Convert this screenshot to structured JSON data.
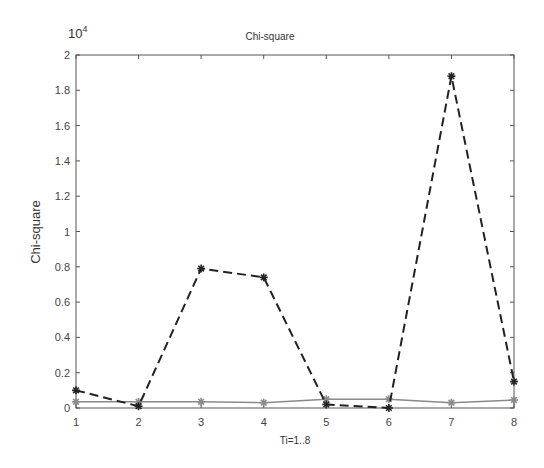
{
  "chart_data": {
    "type": "line",
    "title": "Chi-square",
    "xlabel": "Ti=1..8",
    "ylabel": "Chi-square",
    "y_exponent_label": "10",
    "y_exponent_power": "4",
    "x": [
      1,
      2,
      3,
      4,
      5,
      6,
      7,
      8
    ],
    "x_ticks": [
      "1",
      "2",
      "3",
      "4",
      "5",
      "6",
      "7",
      "8"
    ],
    "y_ticks": [
      "0",
      "0.2",
      "0.4",
      "0.6",
      "0.8",
      "1",
      "1.2",
      "1.4",
      "1.6",
      "1.8",
      "2"
    ],
    "xlim": [
      1,
      8
    ],
    "ylim": [
      0,
      2
    ],
    "y_scale": 10000,
    "grid": false,
    "legend": null,
    "series": [
      {
        "name": "dashed-black",
        "color": "#222222",
        "line_style": "dashed",
        "marker": "*",
        "values": [
          0.1,
          0.01,
          0.79,
          0.74,
          0.02,
          0.0,
          1.88,
          0.15
        ]
      },
      {
        "name": "solid-gray",
        "color": "#8a8a8a",
        "line_style": "solid",
        "marker": "*",
        "values": [
          0.035,
          0.035,
          0.035,
          0.03,
          0.05,
          0.05,
          0.03,
          0.045
        ]
      }
    ]
  }
}
